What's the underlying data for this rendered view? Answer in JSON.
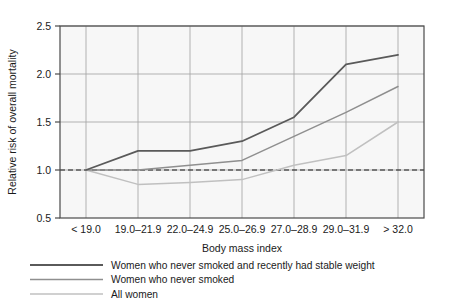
{
  "chart_data": {
    "type": "line",
    "title": "",
    "subtitle": "",
    "xlabel": "Body mass index",
    "ylabel": "Relative risk of overall mortality",
    "categories": [
      "< 19.0",
      "19.0–21.9",
      "22.0–24.9",
      "25.0–26.9",
      "27.0–28.9",
      "29.0–31.9",
      "> 32.0"
    ],
    "ylim": [
      0.5,
      2.5
    ],
    "yticks": [
      0.5,
      1.0,
      1.5,
      2.0,
      2.5
    ],
    "ytick_labels": [
      "0.5",
      "1.0",
      "1.5",
      "2.0",
      "2.5"
    ],
    "grid": true,
    "grid_axis": "both",
    "legend_position": "below",
    "reference_line": {
      "value": 1.0,
      "style": "dashed",
      "color": "#1a1a1a",
      "label": "reference risk 1.0"
    },
    "series": [
      {
        "name": "Women who never smoked and recently had stable weight",
        "color": "#5a5a5a",
        "width": 1.8,
        "values": [
          1.0,
          1.2,
          1.2,
          1.3,
          1.55,
          2.1,
          2.2
        ]
      },
      {
        "name": "Women who never smoked",
        "color": "#8f8f8f",
        "width": 1.5,
        "values": [
          1.0,
          1.0,
          1.05,
          1.1,
          1.35,
          1.6,
          1.87
        ]
      },
      {
        "name": "All women",
        "color": "#c0c0c0",
        "width": 1.5,
        "values": [
          1.0,
          0.85,
          0.87,
          0.9,
          1.05,
          1.15,
          1.5
        ]
      }
    ]
  },
  "axes": {
    "y_title": "Relative risk of overall mortality",
    "x_title": "Body mass index"
  },
  "legend": {
    "entries": [
      {
        "label": "Women who never smoked and recently had stable weight",
        "color": "#5a5a5a"
      },
      {
        "label": "Women who never smoked",
        "color": "#8f8f8f"
      },
      {
        "label": "All women",
        "color": "#c0c0c0"
      }
    ]
  },
  "colors": {
    "plot_background": "#f7f7f7",
    "frame": "#4a4a4a",
    "grid": "#a8a8a8",
    "text": "#1a1a1a"
  }
}
